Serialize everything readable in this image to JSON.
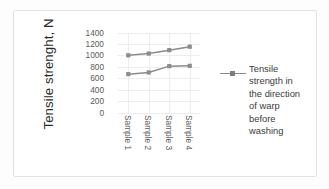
{
  "chart_data": {
    "type": "line",
    "title": "",
    "xlabel": "",
    "ylabel": "Tensile strenght, N",
    "categories": [
      "Sample 1",
      "Sample 2",
      "Sample 3",
      "Sample 4"
    ],
    "ylim": [
      0,
      1400
    ],
    "ytick_step": 200,
    "yticks": [
      "1400",
      "1200",
      "1000",
      "800",
      "600",
      "400",
      "200",
      "0"
    ],
    "grid": "both",
    "legend_position": "right",
    "series": [
      {
        "name": "Tensile strength in the direction of warp before washing",
        "values": [
          1010,
          1040,
          1100,
          1160
        ],
        "color": "#8c8c8c",
        "marker": "square"
      },
      {
        "name": "Tensile strength in the direction of warp after washing",
        "values": [
          680,
          710,
          820,
          825
        ],
        "color": "#8c8c8c",
        "marker": "square"
      }
    ]
  },
  "legend": {
    "lines": [
      "Tensile",
      "strength in",
      "the direction",
      "of warp",
      "before",
      "washing"
    ],
    "full_text": "Tensile strength in the direction of warp before washing",
    "line_color": "#8c8c8c",
    "marker_color": "#7d7d7d"
  },
  "colors": {
    "frame_border": "#e3e3e3",
    "gridline": "#ededed",
    "axis_text": "#5a5a5a",
    "title_text": "#2b2b2b",
    "background": "#ffffff"
  }
}
